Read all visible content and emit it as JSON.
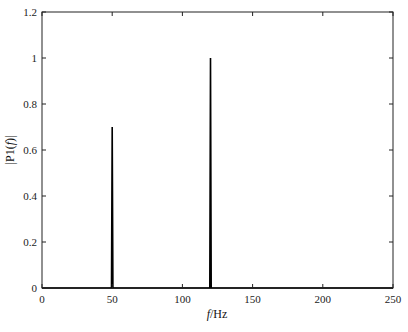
{
  "chart_data": {
    "type": "line",
    "title": "",
    "xlabel": "f/Hz",
    "ylabel": "|P1(f)|",
    "xlim": [
      0,
      250
    ],
    "ylim": [
      0,
      1.2
    ],
    "xticks": [
      0,
      50,
      100,
      150,
      200,
      250
    ],
    "yticks": [
      0,
      0.2,
      0.4,
      0.6,
      0.8,
      1,
      1.2
    ],
    "xtick_labels": [
      "0",
      "50",
      "100",
      "150",
      "200",
      "250"
    ],
    "ytick_labels": [
      "0",
      "0.2",
      "0.4",
      "0.6",
      "0.8",
      "1",
      "1.2"
    ],
    "grid": false,
    "legend": null,
    "series": [
      {
        "name": "P1",
        "x": [
          0,
          49.5,
          50,
          50.5,
          119.5,
          120,
          120.5,
          250
        ],
        "values": [
          0,
          0,
          0.7,
          0,
          0,
          1.0,
          0,
          0
        ]
      }
    ],
    "peaks": [
      {
        "f": 50,
        "amplitude": 0.7
      },
      {
        "f": 120,
        "amplitude": 1.0
      }
    ]
  },
  "labels": {
    "xlabel_italic": "f",
    "xlabel_unit": "/Hz",
    "ylabel_prefix": "|P1(",
    "ylabel_italic": "f",
    "ylabel_suffix": ")|"
  }
}
